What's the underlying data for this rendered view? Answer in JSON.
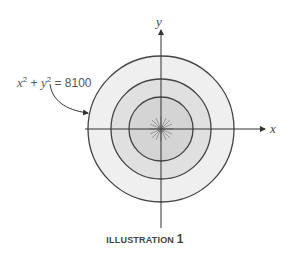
{
  "diagram": {
    "equation": {
      "x": "x",
      "exp1": "2",
      "plus": " + ",
      "y": "y",
      "exp2": "2",
      "rhs": " = 8100"
    },
    "axes": {
      "x_label": "x",
      "y_label": "y"
    },
    "circles": {
      "count": 3,
      "fills": [
        "#f0f0f0",
        "#e2e2e2",
        "#d6d6d6"
      ],
      "stroke": "#444444"
    },
    "caption": {
      "text": "ILLUSTRATION ",
      "number": "1"
    }
  }
}
